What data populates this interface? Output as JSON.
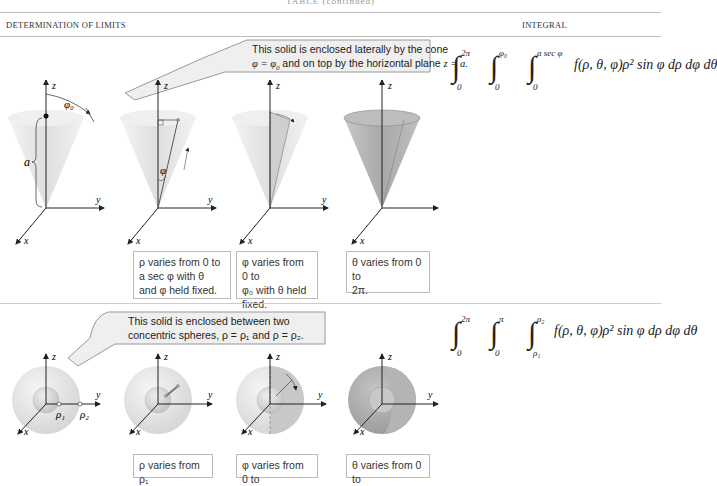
{
  "page": {
    "running_header": "TABLE (continued)",
    "columns": {
      "left": "DETERMINATION OF LIMITS",
      "right": "INTEGRAL"
    }
  },
  "sections": [
    {
      "callout": {
        "line1": "This solid is enclosed laterally by the cone",
        "line2_a": "φ = φ",
        "line2_sub": "0",
        "line2_b": " and on top by the horizontal plane ",
        "line2_c": "z = a."
      },
      "integral": {
        "outer_upper": "2π",
        "outer_lower": "0",
        "middle_upper": "φ₀",
        "middle_lower": "0",
        "inner_upper": "a sec φ",
        "inner_lower": "0",
        "integrand": "f(ρ, θ, φ)ρ² sin φ dρ dφ dθ"
      },
      "figure_labels": {
        "z": "z",
        "y": "y",
        "x": "x",
        "a": "a",
        "phi0": "φ₀",
        "phi": "φ"
      },
      "captions": [
        {
          "l1": "ρ varies from 0 to",
          "l2": "a sec φ with θ",
          "l3": "and φ held fixed."
        },
        {
          "l1": "φ varies from 0 to",
          "l2": "φ₀ with θ held",
          "l3": "fixed."
        },
        {
          "l1": "θ varies from 0 to",
          "l2": "2π.",
          "l3": ""
        }
      ]
    },
    {
      "callout": {
        "line1": "This solid is enclosed between two",
        "line2": "concentric spheres, ρ = ρ₁ and ρ = ρ₂."
      },
      "integral": {
        "outer_upper": "2π",
        "outer_lower": "0",
        "middle_upper": "π",
        "middle_lower": "0",
        "inner_upper": "ρ₂",
        "inner_lower": "ρ₁",
        "integrand": "f(ρ, θ, φ)ρ² sin φ dρ dφ dθ"
      },
      "figure_labels": {
        "z": "z",
        "y": "y",
        "x": "x",
        "rho1": "ρ₁",
        "rho2": "ρ₂"
      },
      "captions": [
        {
          "l1": "ρ varies from ρ₁"
        },
        {
          "l1": "φ varies from 0 to"
        },
        {
          "l1": "θ varies from 0 to"
        }
      ]
    }
  ]
}
